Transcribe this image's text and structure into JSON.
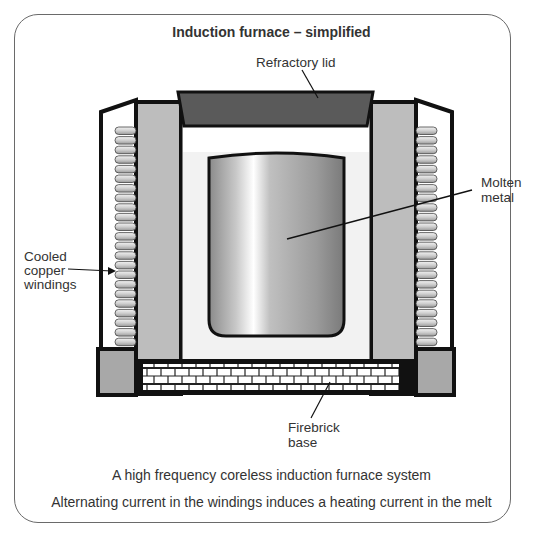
{
  "title": "Induction furnace – simplified",
  "labels": {
    "lid": "Refractory lid",
    "molten_line1": "Molten",
    "molten_line2": "metal",
    "windings_line1": "Cooled",
    "windings_line2": "copper",
    "windings_line3": "windings",
    "base_line1": "Firebrick",
    "base_line2": "base"
  },
  "captions": {
    "line1": "A high frequency coreless induction furnace system",
    "line2": "Alternating current in the windings induces a heating current in the melt"
  },
  "colors": {
    "outline": "#111111",
    "lid": "#5a5a5a",
    "refractory_wall": "#bdbdbd",
    "coil": "#d0d0d0",
    "base_block": "#a8a8a8",
    "frame": "#6a6a6a"
  },
  "coil_count": 23
}
